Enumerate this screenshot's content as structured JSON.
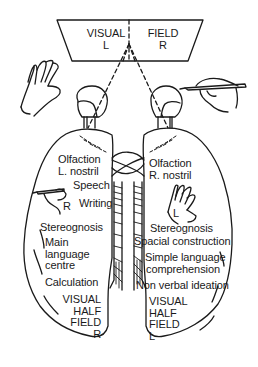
{
  "figure": {
    "visual_field": {
      "left_word": "VISUAL",
      "left_side": "L",
      "right_word": "FIELD",
      "right_side": "R"
    },
    "left_hemisphere": {
      "olfaction_1": "Olfaction",
      "olfaction_2": "L. nostril",
      "speech": "Speech",
      "writing": "Writing",
      "hand_label": "R",
      "stereognosis": "Stereognosis",
      "main_lang_1": "Main",
      "main_lang_2": "language",
      "main_lang_3": "centre",
      "calculation": "Calculation",
      "vhf_1": "VISUAL",
      "vhf_2": "HALF",
      "vhf_3": "FIELD",
      "vhf_4": "R"
    },
    "right_hemisphere": {
      "olfaction_1": "Olfaction",
      "olfaction_2": "R. nostril",
      "hand_label": "L",
      "stereognosis": "Stereognosis",
      "spacial": "Spacial construction",
      "simple_lang_1": "Simple language",
      "simple_lang_2": "comprehension",
      "nonverbal": "Non verbal ideation",
      "vhf_1": "VISUAL",
      "vhf_2": "HALF",
      "vhf_3": "FIELD",
      "vhf_4": "L"
    },
    "colors": {
      "ink": "#1a1a1a",
      "paper": "#ffffff"
    }
  }
}
